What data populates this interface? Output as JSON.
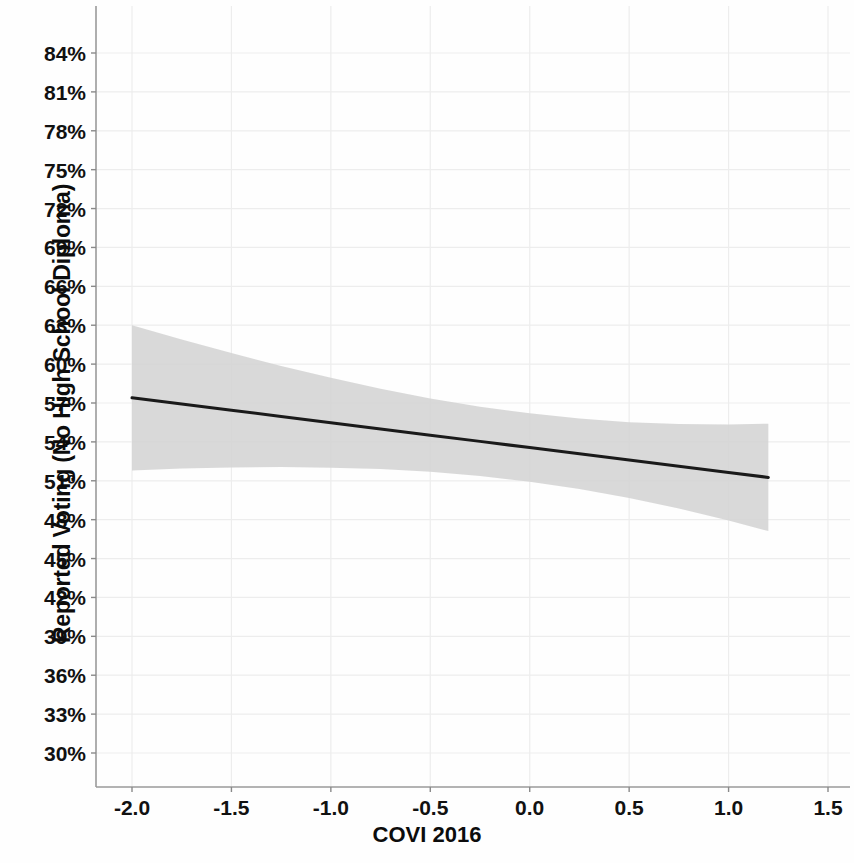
{
  "chart_data": {
    "type": "line",
    "title": "",
    "subtitle": "",
    "xlabel": "COVI 2016",
    "ylabel": "Reported Voting (No High School Diploma)",
    "grid": true,
    "legend": null,
    "xlim": [
      -2.3,
      1.72
    ],
    "ylim": [
      0.285,
      0.858
    ],
    "xticks": [
      -2.0,
      -1.5,
      -1.0,
      -0.5,
      0.0,
      0.5,
      1.0,
      1.5
    ],
    "xtick_labels": [
      "-2.0",
      "-1.5",
      "-1.0",
      "-0.5",
      "0.0",
      "0.5",
      "1.0",
      "1.5"
    ],
    "yticks": [
      0.3,
      0.33,
      0.36,
      0.39,
      0.42,
      0.45,
      0.48,
      0.51,
      0.54,
      0.57,
      0.6,
      0.63,
      0.66,
      0.69,
      0.72,
      0.75,
      0.78,
      0.81,
      0.84
    ],
    "ytick_labels": [
      "30%",
      "33%",
      "36%",
      "39%",
      "42%",
      "45%",
      "48%",
      "51%",
      "54%",
      "57%",
      "60%",
      "63%",
      "66%",
      "69%",
      "72%",
      "75%",
      "78%",
      "81%",
      "84%"
    ],
    "series": [
      {
        "name": "Predicted probability of reported voting",
        "type": "line",
        "color": "#1a1a1a",
        "line_width": 3,
        "x": [
          -2.0,
          -1.75,
          -1.5,
          -1.25,
          -1.0,
          -0.75,
          -0.5,
          -0.25,
          0.0,
          0.25,
          0.5,
          0.75,
          1.0,
          1.2
        ],
        "y": [
          0.574,
          0.5692,
          0.5644,
          0.5596,
          0.5548,
          0.55,
          0.5452,
          0.5404,
          0.5356,
          0.5308,
          0.526,
          0.5212,
          0.5164,
          0.5126
        ]
      }
    ],
    "confidence_band": {
      "name": "95% confidence interval",
      "color": "#d2d2d2",
      "opacity": 0.85,
      "x": [
        -2.0,
        -1.75,
        -1.5,
        -1.25,
        -1.0,
        -0.75,
        -0.5,
        -0.25,
        0.0,
        0.25,
        0.5,
        0.75,
        1.0,
        1.2
      ],
      "upper": [
        0.63,
        0.619,
        0.6085,
        0.5985,
        0.5895,
        0.581,
        0.5735,
        0.5672,
        0.562,
        0.558,
        0.5552,
        0.5538,
        0.5535,
        0.554
      ],
      "lower": [
        0.518,
        0.5194,
        0.5203,
        0.5207,
        0.5201,
        0.519,
        0.5169,
        0.5136,
        0.5092,
        0.5036,
        0.4968,
        0.4886,
        0.4793,
        0.4712
      ]
    }
  },
  "axes": {
    "x_axis_label": "COVI 2016",
    "y_axis_label": "Reported Voting (No High School Diploma)"
  }
}
